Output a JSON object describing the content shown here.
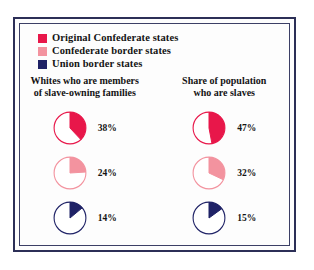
{
  "legend": {
    "items": [
      {
        "label": "Original Confederate states",
        "color": "#e8174a",
        "swatch_icon": "legend-swatch-original-confederate"
      },
      {
        "label": "Confederate border states",
        "color": "#f3939f",
        "swatch_icon": "legend-swatch-confederate-border"
      },
      {
        "label": "Union border states",
        "color": "#1f2266",
        "swatch_icon": "legend-swatch-union-border"
      }
    ]
  },
  "columns": [
    {
      "title": "Whites who are members\nof slave-owning families",
      "values": [
        "38%",
        "24%",
        "14%"
      ]
    },
    {
      "title": "Share of population\nwho are slaves",
      "values": [
        "47%",
        "32%",
        "15%"
      ]
    }
  ],
  "chart_data": {
    "type": "pie",
    "title": "",
    "series": [
      {
        "name": "Whites who are members of slave-owning families",
        "categories": [
          "Original Confederate states",
          "Confederate border states",
          "Union border states"
        ],
        "values": [
          38,
          24,
          14
        ],
        "labels": [
          "38%",
          "24%",
          "14%"
        ],
        "colors": [
          "#e8174a",
          "#f3939f",
          "#1f2266"
        ]
      },
      {
        "name": "Share of population who are slaves",
        "categories": [
          "Original Confederate states",
          "Confederate border states",
          "Union border states"
        ],
        "values": [
          47,
          32,
          15
        ],
        "labels": [
          "47%",
          "32%",
          "15%"
        ],
        "colors": [
          "#e8174a",
          "#f3939f",
          "#1f2266"
        ]
      }
    ],
    "units": "percent",
    "start_angle_deg": 0,
    "direction": "clockwise",
    "legend_position": "top-left",
    "grid": false
  },
  "style": {
    "frame_color": "#2c2f57",
    "background": "#fdfdfd",
    "text_color": "#141414"
  }
}
